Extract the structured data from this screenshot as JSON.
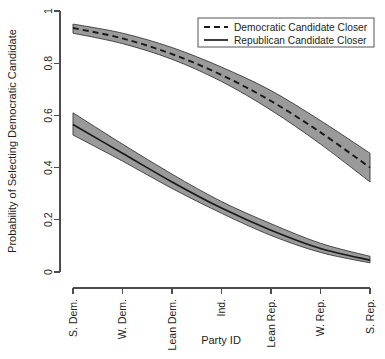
{
  "chart_data": {
    "type": "line",
    "title": "",
    "xlabel": "Party ID",
    "ylabel": "Probability of Selecting Democratic Candidate",
    "categories": [
      "S. Dem.",
      "W. Dem.",
      "Lean Dem.",
      "Ind.",
      "Lean Rep.",
      "W. Rep.",
      "S. Rep."
    ],
    "x": [
      1,
      2,
      3,
      4,
      5,
      6,
      7
    ],
    "xlim": [
      1,
      7
    ],
    "ylim": [
      0,
      1
    ],
    "yticks": [
      0,
      0.2,
      0.4,
      0.6,
      0.8,
      1
    ],
    "ytick_labels": [
      "0",
      "0.2",
      "0.4",
      "0.6",
      "0.8",
      "1"
    ],
    "grid": false,
    "legend_position": "top-right",
    "series": [
      {
        "name": "Democratic Candidate Closer",
        "style": "dashed",
        "values": [
          0.935,
          0.895,
          0.835,
          0.755,
          0.655,
          0.535,
          0.4
        ],
        "ci_lower": [
          0.915,
          0.875,
          0.815,
          0.73,
          0.62,
          0.49,
          0.345
        ],
        "ci_upper": [
          0.95,
          0.915,
          0.86,
          0.785,
          0.695,
          0.58,
          0.455
        ]
      },
      {
        "name": "Republican Candidate Closer",
        "style": "solid",
        "values": [
          0.565,
          0.455,
          0.345,
          0.245,
          0.16,
          0.09,
          0.045
        ],
        "ci_lower": [
          0.525,
          0.425,
          0.32,
          0.225,
          0.14,
          0.075,
          0.035
        ],
        "ci_upper": [
          0.61,
          0.49,
          0.375,
          0.27,
          0.185,
          0.11,
          0.06
        ]
      }
    ]
  },
  "legend": {
    "entries": [
      {
        "label": "Democratic Candidate Closer",
        "style": "dashed"
      },
      {
        "label": "Republican Candidate Closer",
        "style": "solid"
      }
    ]
  },
  "colors": {
    "band_fill": "#9a9a9a",
    "band_edge": "#3a3a3a",
    "curve": "#1a1a1a",
    "axis": "#4d4d4d",
    "text": "#231f20",
    "background": "#ffffff"
  }
}
